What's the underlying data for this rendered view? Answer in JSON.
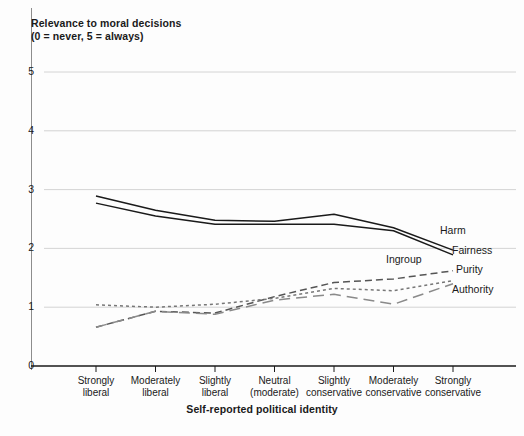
{
  "figure": {
    "y_axis_title": "Relevance to moral decisions\n(0 = never, 5 = always)",
    "x_axis_title": "Self-reported political identity"
  },
  "chart_data": {
    "type": "line",
    "title": "Relevance to moral decisions (0 = never, 5 = always)",
    "xlabel": "Self-reported political identity",
    "ylabel": "Relevance to moral decisions (0 = never, 5 = always)",
    "ylim": [
      0,
      5
    ],
    "yticks": [
      0,
      1,
      2,
      3,
      4,
      5
    ],
    "ytick_labels": [
      "0",
      "1",
      "2",
      "3",
      "4",
      "5"
    ],
    "grid": "horizontal",
    "legend_position": "right-inline",
    "categories": [
      "Strongly\nliberal",
      "Moderately\nliberal",
      "Slightly\nliberal",
      "Neutral\n(moderate)",
      "Slightly\nconservative",
      "Moderately\nconservative",
      "Strongly\nconservative"
    ],
    "series": [
      {
        "name": "Harm",
        "style": "solid",
        "color": "#1a1a1a",
        "values": [
          2.89,
          2.65,
          2.48,
          2.46,
          2.58,
          2.35,
          1.97
        ]
      },
      {
        "name": "Fairness",
        "style": "solid",
        "color": "#1a1a1a",
        "values": [
          2.77,
          2.55,
          2.41,
          2.41,
          2.41,
          2.3,
          1.89
        ]
      },
      {
        "name": "Ingroup",
        "style": "dashed",
        "color": "#555555",
        "values": [
          0.66,
          0.93,
          0.9,
          1.18,
          1.42,
          1.48,
          1.62
        ]
      },
      {
        "name": "Purity",
        "style": "dotted",
        "color": "#777777",
        "values": [
          1.04,
          1.0,
          1.05,
          1.15,
          1.32,
          1.28,
          1.45
        ]
      },
      {
        "name": "Authority",
        "style": "dashed-long",
        "color": "#8a8a8a",
        "values": [
          0.66,
          0.93,
          0.88,
          1.12,
          1.22,
          1.05,
          1.4
        ]
      }
    ]
  },
  "legend": {
    "items": [
      {
        "label": "Harm",
        "x": 440,
        "y": 231
      },
      {
        "label": "Fairness",
        "x": 452,
        "y": 251
      },
      {
        "label": "Ingroup",
        "x": 386,
        "y": 260
      },
      {
        "label": "Purity",
        "x": 456,
        "y": 270
      },
      {
        "label": "Authority",
        "x": 452,
        "y": 290
      }
    ]
  }
}
